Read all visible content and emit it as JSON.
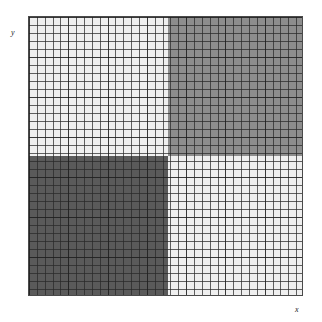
{
  "figure": {
    "background_color": "#ffffff",
    "plot_border_color": "#4a4a4a"
  },
  "axes": {
    "x_label": "x",
    "y_label": "y",
    "x_label_name": "x-axis-label",
    "y_label_name": "y-axis-label",
    "grid": true,
    "tick_labels_shown": false
  },
  "chart_data": {
    "type": "heatmap",
    "title": "",
    "subtitle": "",
    "xlabel": "x",
    "ylabel": "y",
    "xlim": [
      0,
      1
    ],
    "ylim": [
      0,
      1
    ],
    "grid": true,
    "legend": "none",
    "colormap": "grayscale",
    "block_rows": 2,
    "block_cols": 2,
    "cells_x": 35,
    "cells_y": 35,
    "row_labels": [
      "top",
      "bottom"
    ],
    "col_labels": [
      "left",
      "right"
    ],
    "values": [
      [
        0.95,
        0.45
      ],
      [
        0.22,
        0.95
      ]
    ],
    "quadrants": [
      {
        "name": "top-left",
        "row": 0,
        "col": 0,
        "value": 0.95,
        "color": "#efefef",
        "x_start_pct": 0,
        "y_start_pct": 0,
        "width_pct": 51,
        "height_pct": 50
      },
      {
        "name": "top-right",
        "row": 0,
        "col": 1,
        "value": 0.45,
        "color": "#8d8d8d",
        "x_start_pct": 51,
        "y_start_pct": 0,
        "width_pct": 49,
        "height_pct": 50
      },
      {
        "name": "bottom-left",
        "row": 1,
        "col": 0,
        "value": 0.22,
        "color": "#5a5a5a",
        "x_start_pct": 0,
        "y_start_pct": 50,
        "width_pct": 51,
        "height_pct": 50
      },
      {
        "name": "bottom-right",
        "row": 1,
        "col": 1,
        "value": 0.95,
        "color": "#efefef",
        "x_start_pct": 51,
        "y_start_pct": 50,
        "width_pct": 49,
        "height_pct": 50
      }
    ]
  }
}
